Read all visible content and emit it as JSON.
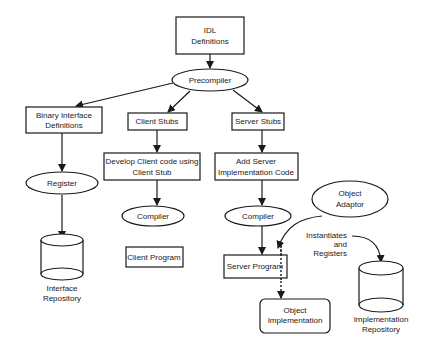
{
  "diagram": {
    "nodes": {
      "idl": {
        "lines": [
          "IDL",
          "Definitions"
        ],
        "shape": "rectangle"
      },
      "precompiler": {
        "lines": [
          "Precompiler"
        ],
        "shape": "ellipse"
      },
      "binary_interface": {
        "lines": [
          "Binary Interface",
          "Definitions"
        ],
        "shape": "rectangle"
      },
      "client_stubs": {
        "lines": [
          "Client Stubs"
        ],
        "shape": "rectangle"
      },
      "server_stubs": {
        "lines": [
          "Server Stubs"
        ],
        "shape": "rectangle"
      },
      "register": {
        "lines": [
          "Register"
        ],
        "shape": "ellipse"
      },
      "develop_client": {
        "lines": [
          "Develop Client code using",
          "Client Stub"
        ],
        "shape": "rectangle"
      },
      "add_server": {
        "lines": [
          "Add Server",
          "Implementation Code"
        ],
        "shape": "rectangle"
      },
      "client_compiler": {
        "lines": [
          "Compiler"
        ],
        "shape": "ellipse"
      },
      "server_compiler": {
        "lines": [
          "Compiler"
        ],
        "shape": "ellipse"
      },
      "client_program": {
        "lines": [
          "Client Program"
        ],
        "shape": "rectangle"
      },
      "server_program": {
        "lines": [
          "Server Program"
        ],
        "shape": "rectangle"
      },
      "object_adaptor": {
        "lines": [
          "Object",
          "Adaptor"
        ],
        "shape": "ellipse"
      },
      "object_implementation": {
        "lines": [
          "Object",
          "Implementation"
        ],
        "shape": "rounded-rectangle"
      },
      "interface_repository": {
        "lines": [
          "Interface",
          "Repository"
        ],
        "shape": "cylinder"
      },
      "implementation_repository": {
        "lines": [
          "Implementation",
          "Repository"
        ],
        "shape": "cylinder"
      }
    },
    "edge_label": {
      "lines": [
        "Instantiates",
        "and",
        "Registers"
      ]
    },
    "edges": [
      {
        "from": "idl",
        "to": "precompiler",
        "style": "solid"
      },
      {
        "from": "precompiler",
        "to": "binary_interface",
        "style": "solid"
      },
      {
        "from": "precompiler",
        "to": "client_stubs",
        "style": "solid"
      },
      {
        "from": "precompiler",
        "to": "server_stubs",
        "style": "solid"
      },
      {
        "from": "binary_interface",
        "to": "register",
        "style": "solid"
      },
      {
        "from": "register",
        "to": "interface_repository",
        "style": "solid"
      },
      {
        "from": "client_stubs",
        "to": "develop_client",
        "style": "solid"
      },
      {
        "from": "develop_client",
        "to": "client_compiler",
        "style": "solid"
      },
      {
        "from": "server_stubs",
        "to": "add_server",
        "style": "solid"
      },
      {
        "from": "add_server",
        "to": "server_compiler",
        "style": "solid"
      },
      {
        "from": "server_compiler",
        "to": "server_program",
        "style": "solid"
      },
      {
        "from": "object_adaptor",
        "to": "server_program",
        "style": "curved"
      },
      {
        "from": "server_program",
        "to": "object_implementation",
        "style": "dashed"
      },
      {
        "from": "edge_label",
        "to": "implementation_repository",
        "style": "curved"
      }
    ]
  }
}
